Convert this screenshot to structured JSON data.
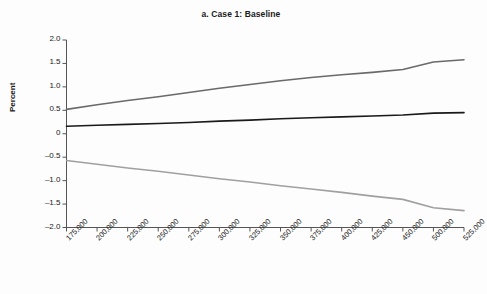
{
  "chart_data": {
    "type": "line",
    "title": "a. Case 1: Baseline",
    "xlabel": "",
    "ylabel": "Percent",
    "ylim": [
      -2.0,
      2.0
    ],
    "yticks": [
      2.0,
      1.5,
      1.0,
      0.5,
      0,
      -0.5,
      -1.0,
      -1.5,
      -2.0
    ],
    "ytick_labels": [
      "2.0",
      "1.5",
      "1.0",
      "0.5",
      "0",
      "–0.5",
      "–1.0",
      "–1.5",
      "–2.0"
    ],
    "grid": false,
    "legend": "none",
    "categories": [
      "175,000",
      "200,000",
      "225,000",
      "250,000",
      "275,000",
      "300,000",
      "325,000",
      "350,000",
      "375,000",
      "400,000",
      "425,000",
      "450,000",
      "500,000",
      "525,000"
    ],
    "series": [
      {
        "name": "upper-bound",
        "color": "#6a6a6a",
        "values": [
          0.52,
          0.62,
          0.71,
          0.79,
          0.88,
          0.97,
          1.05,
          1.13,
          1.2,
          1.26,
          1.31,
          1.37,
          1.53,
          1.58
        ]
      },
      {
        "name": "central-estimate",
        "color": "#1a1a1a",
        "values": [
          0.16,
          0.18,
          0.2,
          0.22,
          0.24,
          0.27,
          0.29,
          0.32,
          0.34,
          0.36,
          0.38,
          0.4,
          0.44,
          0.45
        ]
      },
      {
        "name": "lower-bound",
        "color": "#a0a0a0",
        "values": [
          -0.57,
          -0.65,
          -0.73,
          -0.8,
          -0.88,
          -0.96,
          -1.03,
          -1.11,
          -1.18,
          -1.25,
          -1.33,
          -1.4,
          -1.58,
          -1.64
        ]
      }
    ]
  },
  "axis": {
    "y_title": "Percent"
  }
}
